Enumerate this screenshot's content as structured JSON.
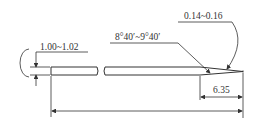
{
  "drawing": {
    "type": "technical-drawing",
    "subject": "tapered pin / needle profile",
    "dimensions": {
      "diameter": "1.00~1.02",
      "taper_angle": "8°40′~9°40′",
      "tip_diameter": "0.14~0.16",
      "taper_length": "6.35"
    }
  },
  "colors": {
    "line": "#333333",
    "background": "#ffffff"
  }
}
